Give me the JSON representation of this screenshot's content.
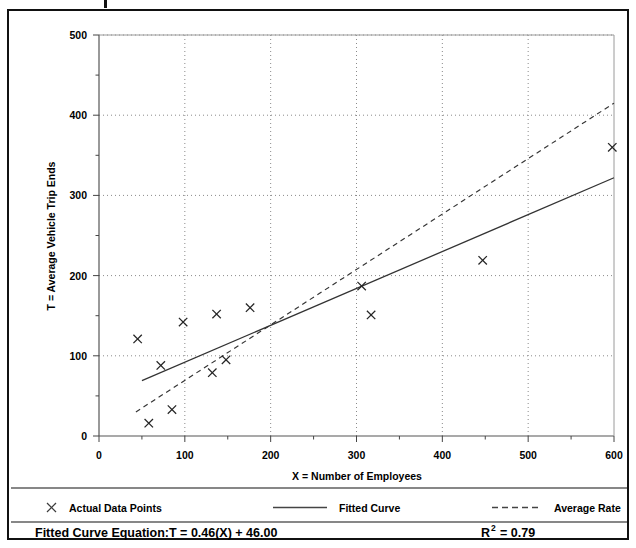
{
  "chart_data": {
    "type": "scatter",
    "title": "",
    "xlabel": "X = Number of Employees",
    "ylabel": "T = Average Vehicle Trip Ends",
    "xlim": [
      0,
      600
    ],
    "ylim": [
      0,
      500
    ],
    "xticks": [
      0,
      100,
      200,
      300,
      400,
      500,
      600
    ],
    "xtick_labels": [
      "0",
      "100",
      "200",
      "300",
      "400",
      "500",
      "600"
    ],
    "yticks": [
      0,
      100,
      200,
      300,
      400,
      500
    ],
    "ytick_labels": [
      "0",
      "100",
      "200",
      "300",
      "400",
      "500"
    ],
    "x_minor_tick_step": 50,
    "y_minor_tick_step": 50,
    "grid": true,
    "grid_style": "dotted",
    "legend_position": "below-axes",
    "series": [
      {
        "name": "Actual Data Points",
        "type": "scatter",
        "marker": "x",
        "color": "#222222",
        "points": [
          [
            45,
            121
          ],
          [
            58,
            16
          ],
          [
            72,
            88
          ],
          [
            85,
            33
          ],
          [
            98,
            142
          ],
          [
            132,
            79
          ],
          [
            137,
            152
          ],
          [
            148,
            95
          ],
          [
            176,
            160
          ],
          [
            306,
            187
          ],
          [
            317,
            151
          ],
          [
            447,
            219
          ],
          [
            598,
            360
          ]
        ]
      },
      {
        "name": "Fitted Curve",
        "type": "line",
        "style": "solid",
        "color": "#333333",
        "equation": "T = 0.46(X) + 46.00",
        "slope": 0.46,
        "intercept": 46.0,
        "x_range": [
          50,
          600
        ],
        "endpoints": [
          [
            50,
            69
          ],
          [
            600,
            322
          ]
        ]
      },
      {
        "name": "Average Rate",
        "type": "line",
        "style": "dashed",
        "color": "#333333",
        "slope": 0.695,
        "intercept": 0,
        "x_range": [
          43,
          600
        ],
        "endpoints": [
          [
            43,
            30
          ],
          [
            600,
            415
          ]
        ]
      }
    ],
    "annotations": {
      "equation_label": "Fitted Curve Equation:",
      "equation_value": "T = 0.46(X) + 46.00",
      "r_squared_label": "R",
      "r_squared_exponent": "2",
      "r_squared_value": "= 0.79"
    }
  },
  "legend": {
    "items": [
      {
        "label": "Actual Data Points",
        "marker": "x-marker-icon"
      },
      {
        "label": "Fitted Curve",
        "marker": "solid-line-icon"
      },
      {
        "label": "Average Rate",
        "marker": "dashed-line-icon"
      }
    ]
  }
}
